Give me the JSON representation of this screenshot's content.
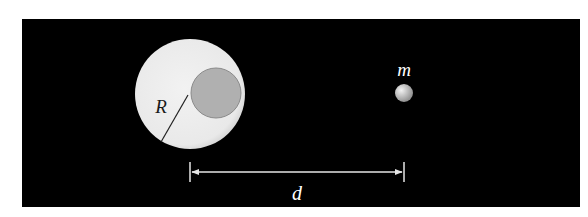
{
  "diagram": {
    "background_color": "#ffffff",
    "panel": {
      "x": 22,
      "y": 19,
      "width": 558,
      "height": 188,
      "color": "#000000"
    },
    "large_sphere": {
      "label": "R",
      "cx": 190,
      "cy": 94,
      "r": 55,
      "fill": "#eeeeee",
      "radius_line": {
        "x1": 188,
        "y1": 95,
        "x2": 161,
        "y2": 142,
        "color": "#222222"
      },
      "label_x": 161,
      "label_y": 113
    },
    "cavity": {
      "cx": 216,
      "cy": 93,
      "r": 25,
      "fill": "#b0b0b0",
      "stroke": "#8a8a8a"
    },
    "small_mass": {
      "label": "m",
      "cx": 404,
      "cy": 93,
      "r": 9,
      "fill": "#b8b8b8",
      "label_x": 404,
      "label_y": 76
    },
    "distance": {
      "label": "d",
      "x1": 190,
      "x2": 404,
      "y": 172,
      "tick_top": 162,
      "tick_bottom": 182,
      "color": "#e6e6e6",
      "label_x": 297,
      "label_y": 200
    }
  }
}
